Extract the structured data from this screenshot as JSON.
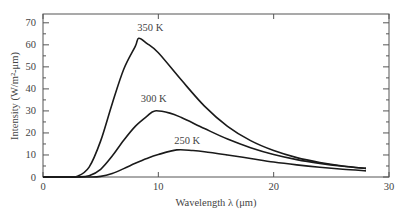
{
  "chart_data": {
    "type": "line",
    "title": "",
    "xlabel": "Wavelength λ (μm)",
    "ylabel": "Intensity (W/m²-μm)",
    "xlim": [
      0,
      30
    ],
    "ylim": [
      0,
      74
    ],
    "xticks": [
      0,
      10,
      20,
      30
    ],
    "yticks": [
      0,
      10,
      20,
      30,
      40,
      50,
      60,
      70
    ],
    "grid": false,
    "legend": "inline curve labels",
    "series": [
      {
        "name": "350 K",
        "T": 350,
        "label_pos": [
          9.3,
          66.5
        ],
        "x": [
          2,
          3,
          4,
          5,
          6,
          7,
          8,
          8.3,
          9,
          10,
          12,
          14,
          16,
          18,
          20,
          22,
          24,
          26,
          28
        ],
        "values": [
          0.0,
          0.4,
          4.5,
          16.4,
          33.3,
          48.9,
          59.3,
          63.0,
          60.7,
          56.4,
          44.0,
          32.2,
          23.0,
          16.5,
          12.0,
          8.8,
          6.6,
          5.0,
          3.9
        ]
      },
      {
        "name": "300 K",
        "T": 300,
        "label_pos": [
          9.6,
          34.0
        ],
        "x": [
          2,
          3,
          4,
          5,
          6,
          7,
          8,
          9,
          9.7,
          11,
          12,
          14,
          16,
          18,
          20,
          22,
          24,
          26,
          28
        ],
        "values": [
          0.0,
          0.0,
          0.6,
          3.5,
          9.5,
          16.7,
          23.0,
          27.5,
          30.0,
          29.0,
          27.0,
          22.0,
          17.2,
          13.3,
          10.2,
          7.9,
          6.2,
          4.9,
          3.9
        ]
      },
      {
        "name": "250 K",
        "T": 250,
        "label_pos": [
          12.5,
          15.0
        ],
        "x": [
          2,
          3,
          4,
          5,
          6,
          7,
          8,
          9,
          10,
          11.6,
          13,
          14,
          16,
          18,
          20,
          22,
          24,
          26,
          28
        ],
        "values": [
          0.0,
          0.0,
          0.0,
          0.3,
          1.6,
          3.8,
          6.2,
          8.4,
          10.2,
          12.3,
          12.0,
          11.5,
          10.0,
          8.4,
          6.8,
          5.5,
          4.4,
          3.5,
          2.8
        ]
      }
    ]
  }
}
